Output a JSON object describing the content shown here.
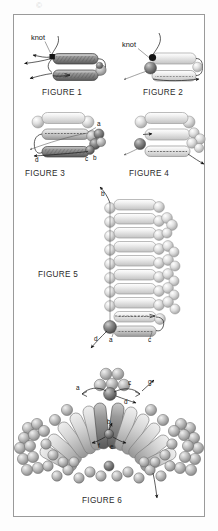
{
  "page": {
    "background": "#ffffff",
    "frame_color": "#9a9a9a",
    "top_mark": "©"
  },
  "figures": [
    {
      "id": "figure-1",
      "caption": "FIGURE 1",
      "annotations": [
        "knot"
      ],
      "description": "Two dark hatched rod (helix) segments stacked, joined at left by a black knot node with four arrows radiating left; a shaded sphere pair caps the right end."
    },
    {
      "id": "figure-2",
      "caption": "FIGURE 2",
      "annotations": [
        "knot"
      ],
      "description": "One light rod above one dashed rod, joined at left by a black knot dot over a dark shaded sphere; arrows exit lower-left and right."
    },
    {
      "id": "figure-3",
      "caption": "FIGURE 3",
      "annotations": [
        "a",
        "b",
        "c",
        "d"
      ],
      "description": "Three stacked rods; top light rod with end spheres, middle dashed rod labelled a at right, bottom dark hatched rod with labels c and b at right and arrow to d at left."
    },
    {
      "id": "figure-4",
      "caption": "FIGURE 4",
      "annotations": [],
      "description": "Three stacked light rods with a cluster of spheres at right, a dark knot sphere at left and an arrow exiting lower right."
    },
    {
      "id": "figure-5",
      "caption": "FIGURE 5",
      "annotations": [
        "b",
        "d",
        "a",
        "c"
      ],
      "description": "A vertical ladder of eight light rods, spheres at both ends of each rod and sphere clusters on the right; arrow labelled b leaves the top left, labels d, a, c at the bottom near a dark knot sphere."
    },
    {
      "id": "figure-6",
      "caption": "FIGURE 6",
      "annotations": [
        "a",
        "c",
        "d",
        "g",
        "b",
        "f",
        "e"
      ],
      "description": "Radial fan / arch of rods emanating outward with sphere clusters at the outer ends; central sphere triangle at top with labels a, c, d, g and inner labels b, f, e; an arrow exits at lower right."
    }
  ],
  "colors": {
    "rod_light_fill": "#e9e9e9",
    "rod_light_stroke": "#9d9d9d",
    "rod_dark_fill": "#8d8d8d",
    "rod_dark_stroke": "#444444",
    "sphere_light": "#dcdcdc",
    "sphere_mid": "#b4b4b4",
    "sphere_dark": "#6f6f6f",
    "knot_black": "#111111",
    "line": "#1a1a1a",
    "caption_text": "#2b2b2b"
  }
}
